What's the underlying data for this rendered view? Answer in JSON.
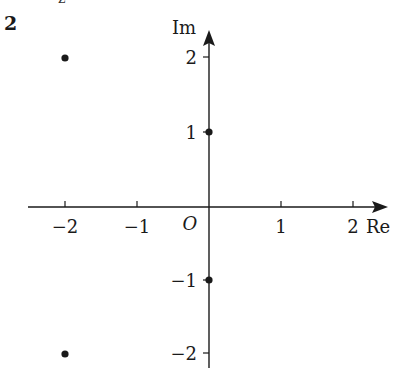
{
  "problem_number": "2",
  "top_cropped_label": "z",
  "axes": {
    "x_label": "Re",
    "y_label": "Im",
    "origin_label": "O",
    "x_ticks": [
      "−2",
      "−1",
      "1",
      "2"
    ],
    "y_ticks": [
      "2",
      "1",
      "−1",
      "−2"
    ]
  },
  "points": [
    {
      "re": -2,
      "im": 2
    },
    {
      "re": 0,
      "im": 1
    },
    {
      "re": 0,
      "im": -1
    },
    {
      "re": -2,
      "im": -2
    }
  ],
  "colors": {
    "ink": "#1a1a1a",
    "background": "#ffffff"
  }
}
